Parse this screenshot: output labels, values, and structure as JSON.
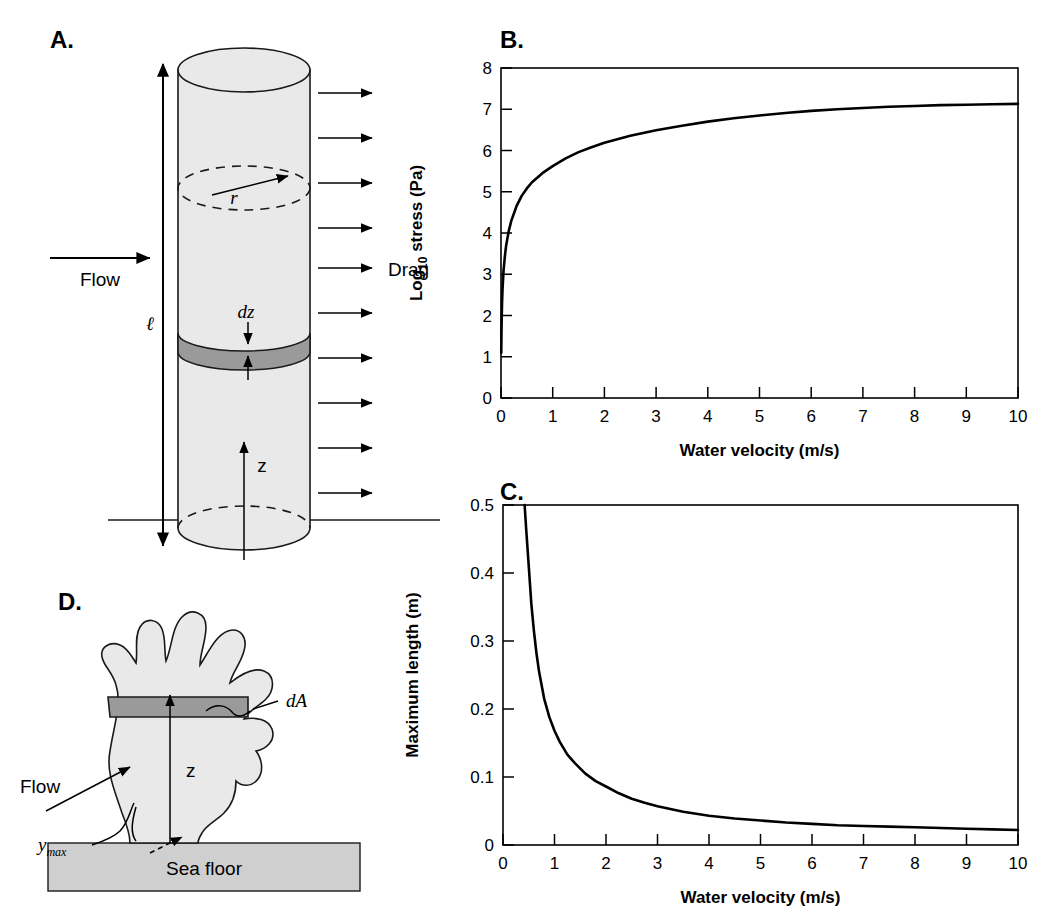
{
  "figure": {
    "panels": [
      {
        "id": "A",
        "letter": "A."
      },
      {
        "id": "B",
        "letter": "B."
      },
      {
        "id": "C",
        "letter": "C."
      },
      {
        "id": "D",
        "letter": "D."
      }
    ]
  },
  "panel_a": {
    "letter": "A.",
    "labels": {
      "flow": "Flow",
      "drag": "Drag",
      "length": "ℓ",
      "radius": "r",
      "dz": "dz",
      "z": "z"
    },
    "colors": {
      "body": "#e9e9e9",
      "band": "#9a9a9a",
      "outline": "#1a1a1a"
    },
    "drag_arrow_count": 10
  },
  "panel_d": {
    "letter": "D.",
    "labels": {
      "flow": "Flow",
      "dA": "dA",
      "z": "z",
      "y_max_base": "y",
      "y_max_sub": "max",
      "sea_floor": "Sea floor"
    },
    "colors": {
      "body": "#e9e9e9",
      "band": "#9a9a9a",
      "floor": "#cfcfcf",
      "outline": "#1a1a1a"
    }
  },
  "chart_data": [
    {
      "panel": "B",
      "type": "line",
      "title": "",
      "xlabel": "Water velocity (m/s)",
      "ylabel": "Log10 stress (Pa)",
      "ylabel_base": "Log",
      "ylabel_sub": "10",
      "ylabel_rest": " stress (Pa)",
      "xlim": [
        0,
        10
      ],
      "ylim": [
        0,
        8
      ],
      "xticks": [
        0,
        1,
        2,
        3,
        4,
        5,
        6,
        7,
        8,
        9,
        10
      ],
      "yticks": [
        0,
        1,
        2,
        3,
        4,
        5,
        6,
        7,
        8
      ],
      "xticklabels": [
        "0",
        "1",
        "2",
        "3",
        "4",
        "5",
        "6",
        "7",
        "8",
        "9",
        "10"
      ],
      "yticklabels": [
        "0",
        "1",
        "2",
        "3",
        "4",
        "5",
        "6",
        "7",
        "8"
      ],
      "grid": false,
      "legend": "none",
      "series": [
        {
          "name": "Log10 stress vs water velocity",
          "x": [
            0.005,
            0.01,
            0.02,
            0.03,
            0.05,
            0.08,
            0.1,
            0.15,
            0.2,
            0.3,
            0.4,
            0.5,
            0.6,
            0.8,
            1.0,
            1.25,
            1.5,
            1.75,
            2.0,
            2.5,
            3.0,
            3.5,
            4.0,
            4.5,
            5.0,
            5.5,
            6.0,
            6.5,
            7.0,
            7.5,
            8.0,
            8.5,
            9.0,
            9.5,
            10.0
          ],
          "y": [
            1.1,
            1.7,
            2.3,
            2.65,
            3.1,
            3.5,
            3.7,
            4.05,
            4.3,
            4.65,
            4.9,
            5.08,
            5.23,
            5.45,
            5.62,
            5.81,
            5.96,
            6.08,
            6.19,
            6.36,
            6.49,
            6.6,
            6.7,
            6.78,
            6.85,
            6.91,
            6.96,
            7.0,
            7.03,
            7.06,
            7.08,
            7.1,
            7.11,
            7.12,
            7.13
          ]
        }
      ]
    },
    {
      "panel": "C",
      "type": "line",
      "title": "",
      "xlabel": "Water velocity (m/s)",
      "ylabel": "Maximum length (m)",
      "xlim": [
        0,
        10
      ],
      "ylim": [
        0,
        0.5
      ],
      "xticks": [
        0,
        1,
        2,
        3,
        4,
        5,
        6,
        7,
        8,
        9,
        10
      ],
      "yticks": [
        0,
        0.1,
        0.2,
        0.3,
        0.4,
        0.5
      ],
      "xticklabels": [
        "0",
        "1",
        "2",
        "3",
        "4",
        "5",
        "6",
        "7",
        "8",
        "9",
        "10"
      ],
      "yticklabels": [
        "0",
        "0.1",
        "0.2",
        "0.3",
        "0.4",
        "0.5"
      ],
      "grid": false,
      "legend": "none",
      "series": [
        {
          "name": "Maximum length vs water velocity",
          "x": [
            0.42,
            0.45,
            0.5,
            0.55,
            0.6,
            0.65,
            0.7,
            0.8,
            0.9,
            1.0,
            1.1,
            1.25,
            1.4,
            1.6,
            1.8,
            2.0,
            2.25,
            2.5,
            2.75,
            3.0,
            3.5,
            4.0,
            4.5,
            5.0,
            5.5,
            6.0,
            6.5,
            7.0,
            7.5,
            8.0,
            8.5,
            9.0,
            9.5,
            10.0
          ],
          "y": [
            0.5,
            0.465,
            0.41,
            0.355,
            0.315,
            0.282,
            0.255,
            0.215,
            0.188,
            0.168,
            0.152,
            0.133,
            0.12,
            0.105,
            0.094,
            0.086,
            0.076,
            0.068,
            0.062,
            0.057,
            0.049,
            0.043,
            0.039,
            0.036,
            0.033,
            0.031,
            0.029,
            0.028,
            0.027,
            0.026,
            0.025,
            0.024,
            0.023,
            0.022
          ]
        }
      ]
    }
  ]
}
